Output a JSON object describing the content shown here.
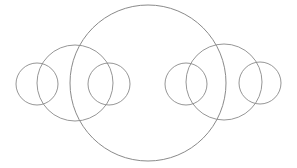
{
  "figure": {
    "background_color": "#ffffff",
    "stroke_color": "#8a8a8a",
    "stroke_width": 0.9,
    "canvas": {
      "width": 297,
      "height": 168
    },
    "symmetry_axis_x": 148,
    "baseline_y": 83,
    "circle_count": 7,
    "circles": [
      {
        "name": "small-circle-far-left",
        "cx": 37,
        "cy": 84,
        "r": 21,
        "size_class": "small"
      },
      {
        "name": "medium-circle-left",
        "cx": 75,
        "cy": 83,
        "r": 38,
        "size_class": "medium"
      },
      {
        "name": "small-circle-inner-left",
        "cx": 109,
        "cy": 84,
        "r": 21,
        "size_class": "small"
      },
      {
        "name": "large-circle-center",
        "cx": 148,
        "cy": 83,
        "r": 78,
        "size_class": "large"
      },
      {
        "name": "small-circle-inner-right",
        "cx": 186,
        "cy": 84,
        "r": 21,
        "size_class": "small"
      },
      {
        "name": "medium-circle-right",
        "cx": 224,
        "cy": 82,
        "r": 38,
        "size_class": "medium"
      },
      {
        "name": "small-circle-far-right",
        "cx": 260,
        "cy": 83,
        "r": 21,
        "size_class": "small"
      }
    ]
  }
}
